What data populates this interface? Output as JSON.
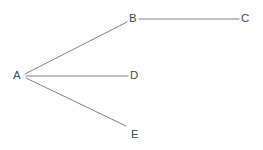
{
  "diagram": {
    "background_color": "#ffffff",
    "edge_color": "#808080",
    "edge_width": 1,
    "label_color": "#4a4a4a",
    "nodes": [
      {
        "id": "A",
        "label": "A",
        "label_x": 13,
        "label_y": 69,
        "anchor_x": 24,
        "anchor_y": 76
      },
      {
        "id": "B",
        "label": "B",
        "label_x": 129,
        "label_y": 12,
        "anchor_x": 127,
        "anchor_y": 22
      },
      {
        "id": "C",
        "label": "C",
        "label_x": 241,
        "label_y": 12,
        "anchor_x": 239,
        "anchor_y": 19
      },
      {
        "id": "D",
        "label": "D",
        "label_x": 130,
        "label_y": 69,
        "anchor_x": 128,
        "anchor_y": 76
      },
      {
        "id": "E",
        "label": "E",
        "label_x": 131,
        "label_y": 128,
        "anchor_x": 126,
        "anchor_y": 126
      }
    ],
    "edges": [
      {
        "id": "edge-a-b",
        "from": "A",
        "to": "B",
        "x1": 25,
        "y1": 74,
        "x2": 127,
        "y2": 22
      },
      {
        "id": "edge-a-d",
        "from": "A",
        "to": "D",
        "x1": 26,
        "y1": 76,
        "x2": 128,
        "y2": 76
      },
      {
        "id": "edge-a-e",
        "from": "A",
        "to": "E",
        "x1": 26,
        "y1": 78,
        "x2": 126,
        "y2": 126
      },
      {
        "id": "edge-b-c",
        "from": "B",
        "to": "C",
        "x1": 139,
        "y1": 19,
        "x2": 239,
        "y2": 19
      }
    ]
  }
}
